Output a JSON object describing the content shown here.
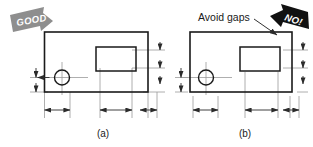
{
  "figure": {
    "background_color": "#ffffff",
    "line_color": "#1a1a1a",
    "thin_line_color": "#9a9a9a",
    "badges": {
      "good": {
        "label": "GOOD",
        "color": "#8e8e8e",
        "text_color": "#ffffff",
        "icon": "arrow-badge-right-down-icon"
      },
      "no": {
        "label": "NO!",
        "color": "#111111",
        "text_color": "#ffffff",
        "icon": "arrow-badge-left-down-icon"
      }
    },
    "annotations": [
      {
        "text": "Avoid gaps",
        "leader": "leader-line-to-gap-icon"
      }
    ],
    "captions": {
      "left": "(a)",
      "right": "(b)"
    },
    "panel_a": {
      "caption": "(a)",
      "description": "Extension lines touch the object outline",
      "shape": "rectangle-with-rectangular-cutout-and-hole"
    },
    "panel_b": {
      "caption": "(b)",
      "description": "Extension lines have gaps from the object outline",
      "shape": "rectangle-with-rectangular-cutout-and-hole"
    }
  }
}
